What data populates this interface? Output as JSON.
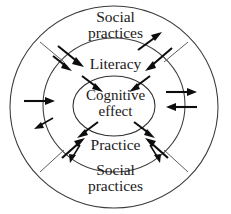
{
  "diagram": {
    "background_color": "#ffffff",
    "stroke_color": "#3b3b3b",
    "arrow_color": "#0d0d0d",
    "text_color": "#1a1a1a",
    "rings": [
      {
        "name": "outer-ring",
        "label_top": "Social practices",
        "label_bottom": "Social practices"
      },
      {
        "name": "middle-ring",
        "label_top": "Literacy",
        "label_bottom": "Practice"
      },
      {
        "name": "inner-ellipse",
        "label": "Cognitive effect"
      }
    ],
    "labels": {
      "social_top_line1": "Social",
      "social_top_line2": "practices",
      "literacy": "Literacy",
      "cognitive_line1": "Cognitive",
      "cognitive_line2": "effect",
      "practice": "Practice",
      "social_bottom_line1": "Social",
      "social_bottom_line2": "practices"
    },
    "arrows": [
      {
        "name": "arrow-outer-to-literacy-a",
        "direction": "inward",
        "region": "upper-left"
      },
      {
        "name": "arrow-outer-to-literacy-b",
        "direction": "inward",
        "region": "upper-left"
      },
      {
        "name": "arrow-outer-to-middle-upper-right",
        "direction": "inward",
        "region": "upper-right"
      },
      {
        "name": "arrow-middle-to-outer-upper-right",
        "direction": "outward",
        "region": "upper-right"
      },
      {
        "name": "arrow-literacy-to-cognitive-left",
        "direction": "inward",
        "region": "center-top-left"
      },
      {
        "name": "arrow-literacy-to-cognitive-right",
        "direction": "inward",
        "region": "center-top-right"
      },
      {
        "name": "arrow-cognitive-to-practice-left",
        "direction": "outward",
        "region": "center-bottom-left"
      },
      {
        "name": "arrow-cognitive-to-practice-right",
        "direction": "outward",
        "region": "center-bottom-right"
      },
      {
        "name": "arrow-left-inward",
        "direction": "inward",
        "region": "left"
      },
      {
        "name": "arrow-left-outward-diagonal",
        "direction": "outward",
        "region": "left-lower"
      },
      {
        "name": "arrow-right-outward",
        "direction": "outward",
        "region": "right-upper"
      },
      {
        "name": "arrow-right-inward",
        "direction": "inward",
        "region": "right-lower"
      },
      {
        "name": "arrow-practice-to-outer-left",
        "direction": "outward",
        "region": "lower-left"
      },
      {
        "name": "arrow-outer-to-practice-left",
        "direction": "inward",
        "region": "lower-left"
      },
      {
        "name": "arrow-outer-to-practice-right",
        "direction": "inward",
        "region": "lower-right"
      },
      {
        "name": "arrow-practice-to-outer-right",
        "direction": "outward",
        "region": "lower-right"
      }
    ]
  }
}
